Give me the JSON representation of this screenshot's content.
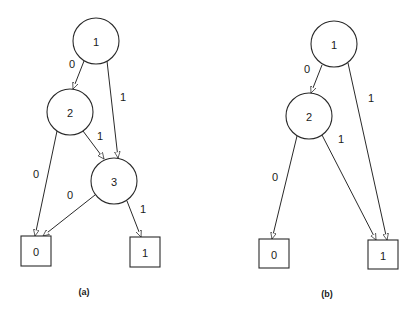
{
  "diagrams": [
    {
      "caption": "(a)",
      "caption_pos": [
        84,
        292
      ],
      "nodes": [
        {
          "id": "a1",
          "label": "1",
          "shape": "circle",
          "cx": 96,
          "cy": 41,
          "r": 23
        },
        {
          "id": "a2",
          "label": "2",
          "shape": "circle",
          "cx": 70,
          "cy": 112,
          "r": 23
        },
        {
          "id": "a3",
          "label": "3",
          "shape": "circle",
          "cx": 114,
          "cy": 181,
          "r": 23
        },
        {
          "id": "a0t",
          "label": "0",
          "shape": "box",
          "x": 21,
          "y": 236,
          "w": 30,
          "h": 30
        },
        {
          "id": "a1t",
          "label": "1",
          "shape": "box",
          "x": 130,
          "y": 237,
          "w": 30,
          "h": 30
        }
      ],
      "edges": [
        {
          "from": "a1",
          "to": "a2",
          "label": "0",
          "x1": 84,
          "y1": 61,
          "x2": 73,
          "y2": 89,
          "lx": 72,
          "ly": 64
        },
        {
          "from": "a1",
          "to": "a3",
          "label": "1",
          "x1": 107,
          "y1": 61,
          "x2": 118,
          "y2": 158,
          "lx": 123,
          "ly": 97
        },
        {
          "from": "a2",
          "to": "a3",
          "label": "1",
          "x1": 83,
          "y1": 131,
          "x2": 104,
          "y2": 159,
          "lx": 100,
          "ly": 136
        },
        {
          "from": "a2",
          "to": "a0t",
          "label": "0",
          "x1": 57,
          "y1": 131,
          "x2": 35,
          "y2": 236,
          "lx": 36,
          "ly": 174
        },
        {
          "from": "a3",
          "to": "a0t",
          "label": "0",
          "x1": 95,
          "y1": 195,
          "x2": 43,
          "y2": 236,
          "lx": 70,
          "ly": 195
        },
        {
          "from": "a3",
          "to": "a1t",
          "label": "1",
          "x1": 127,
          "y1": 201,
          "x2": 141,
          "y2": 237,
          "lx": 143,
          "ly": 209
        }
      ]
    },
    {
      "caption": "(b)",
      "caption_pos": [
        327,
        294
      ],
      "nodes": [
        {
          "id": "b1",
          "label": "1",
          "shape": "circle",
          "cx": 334,
          "cy": 44,
          "r": 23
        },
        {
          "id": "b2",
          "label": "2",
          "shape": "circle",
          "cx": 309,
          "cy": 116,
          "r": 23
        },
        {
          "id": "b0t",
          "label": "0",
          "shape": "box",
          "x": 259,
          "y": 239,
          "w": 30,
          "h": 29
        },
        {
          "id": "b1t",
          "label": "1",
          "shape": "box",
          "x": 368,
          "y": 240,
          "w": 30,
          "h": 29
        }
      ],
      "edges": [
        {
          "from": "b1",
          "to": "b2",
          "label": "0",
          "x1": 322,
          "y1": 65,
          "x2": 311,
          "y2": 93,
          "lx": 307,
          "ly": 69
        },
        {
          "from": "b1",
          "to": "b1t",
          "label": "1",
          "x1": 348,
          "y1": 63,
          "x2": 387,
          "y2": 240,
          "lx": 371,
          "ly": 98
        },
        {
          "from": "b2",
          "to": "b1t",
          "label": "1",
          "x1": 322,
          "y1": 135,
          "x2": 376,
          "y2": 240,
          "lx": 341,
          "ly": 139
        },
        {
          "from": "b2",
          "to": "b0t",
          "label": "0",
          "x1": 297,
          "y1": 136,
          "x2": 272,
          "y2": 239,
          "lx": 275,
          "ly": 177
        }
      ]
    }
  ]
}
